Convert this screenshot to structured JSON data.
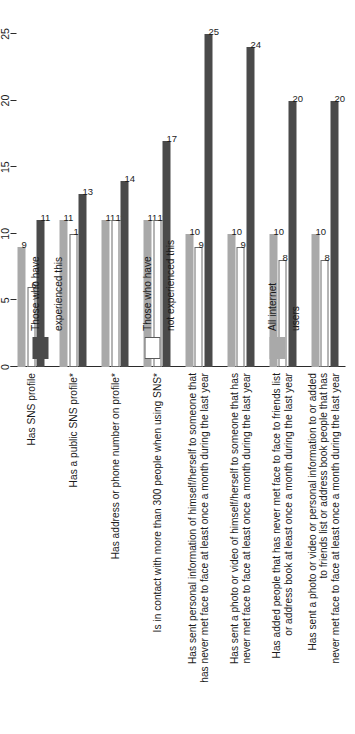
{
  "chart_data": {
    "type": "bar",
    "orientation": "horizontal",
    "title": "",
    "subtitle": "",
    "xlabel": "",
    "ylabel": "",
    "xlim": [
      0,
      25
    ],
    "ticks": [
      "0",
      "5",
      "10",
      "15",
      "20",
      "25"
    ],
    "grid": false,
    "legend_position": "bottom-right",
    "categories": [
      "Has SNS profile",
      "Has a public SNS profile*",
      "Has address or phone number on profile*",
      "Is in contact with more than 300 people when using SNS*",
      "Has sent personal information of himself/herself to someone that\nhas never met face to face at least once a month during the last year",
      "Has sent a photo or video of himself/herself to someone that has\nnever met face to face at least once a month during the last year",
      "Has added people that has never met face to face to friends list\nor address book at least once a month during the last year",
      "Has sent a photo or video or personal information to or added\nto friends list or address book people that has\nnever met face to face at least once a month during the last year"
    ],
    "series": [
      {
        "name": "Those who have\nexperienced this",
        "color": "#4a4a4a",
        "values": [
          11,
          13,
          14,
          17,
          25,
          24,
          20,
          20
        ]
      },
      {
        "name": "Those who have\nnot experienced this",
        "color": "#ffffff",
        "values": [
          null,
          10,
          11,
          11,
          10,
          9,
          8,
          8
        ]
      },
      {
        "name": "All internet\nusers",
        "color": "#a9a9a9",
        "values": [
          9,
          11,
          11,
          11,
          10,
          10,
          10,
          10
        ]
      }
    ],
    "bar_labels": {
      "Has SNS profile": {
        "experienced": "11",
        "not_experienced": "6",
        "all_internet_users": "9"
      },
      "Has a public SNS profile*": {
        "experienced": "13",
        "not_experienced": "10",
        "all_internet_users": "11"
      },
      "Has address or phone number on profile*": {
        "experienced": "14",
        "not_experienced": "11",
        "all_internet_users": "11"
      },
      "Is in contact with more than 300 people when using SNS*": {
        "experienced": "17",
        "not_experienced": "11",
        "all_internet_users": "11"
      },
      "Has sent personal information of himself/herself to someone that has never met face to face at least once a month during the last year": {
        "experienced": "25",
        "not_experienced": "9",
        "all_internet_users": "10"
      },
      "Has sent a photo or video of himself/herself to someone that has never met face to face at least once a month during the last year": {
        "experienced": "24",
        "not_experienced": "9",
        "all_internet_users": "10"
      },
      "Has added people that has never met face to face to friends list or address book at least once a month during the last year": {
        "experienced": "20",
        "not_experienced": "8",
        "all_internet_users": "10"
      },
      "Has sent a photo or video or personal information to or added to friends list or address book people that has never met face to face at least once a month during the last year": {
        "experienced": "20",
        "not_experienced": "8",
        "all_internet_users": "10"
      }
    }
  },
  "axis": {
    "tick_0": "0",
    "tick_1": "5",
    "tick_2": "10",
    "tick_3": "15",
    "tick_4": "20",
    "tick_5": "25"
  },
  "categories": {
    "c0": "Has SNS profile",
    "c1": "Has a public SNS profile*",
    "c2": "Has address or phone number on profile*",
    "c3": "Is in contact with more than 300 people when using SNS*",
    "c4_l1": "Has sent personal information of himself/herself to someone that",
    "c4_l2": "has never met face to face at least once a month during the last year",
    "c5_l1": "Has sent a photo or video of himself/herself to someone that has",
    "c5_l2": "never met face to face at least once a month during the last year",
    "c6_l1": "Has added people that has never met face to face to friends list",
    "c6_l2": "or address book at least once a month during the last year",
    "c7_l1": "Has sent a photo or video or personal information to or added",
    "c7_l2": "to friends list or address book people that has",
    "c7_l3": "never met face to face at least once a month during the last year"
  },
  "values": {
    "g0": {
      "exp": "11",
      "notexp": "6",
      "all": "9"
    },
    "g1": {
      "exp": "13",
      "notexp": "10",
      "all": "11"
    },
    "g2": {
      "exp": "14",
      "notexp": "11",
      "all": "11"
    },
    "g3": {
      "exp": "17",
      "notexp": "11",
      "all": "11"
    },
    "g4": {
      "exp": "25",
      "notexp": "9",
      "all": "10"
    },
    "g5": {
      "exp": "24",
      "notexp": "9",
      "all": "10"
    },
    "g6": {
      "exp": "20",
      "notexp": "8",
      "all": "10"
    },
    "g7": {
      "exp": "20",
      "notexp": "8",
      "all": "10"
    }
  },
  "legend": {
    "exp_l1": "Those who have",
    "exp_l2": "experienced this",
    "notexp_l1": "Those who have",
    "notexp_l2": "not experienced this",
    "all_l1": "All internet",
    "all_l2": "users"
  }
}
